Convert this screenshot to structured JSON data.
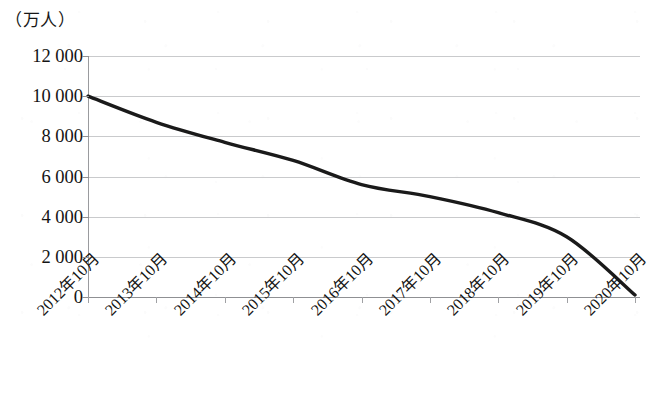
{
  "chart_data": {
    "type": "line",
    "title": "",
    "subtitle": "",
    "xlabel": "",
    "ylabel": "（万人）",
    "y_axis_unit_caption": "（万人）",
    "categories": [
      "2012年10月",
      "2013年10月",
      "2014年10月",
      "2015年10月",
      "2016年10月",
      "2017年10月",
      "2018年10月",
      "2019年10月",
      "2020年10月"
    ],
    "values": [
      10000,
      8700,
      7700,
      6800,
      5600,
      5000,
      4200,
      3000,
      100
    ],
    "series": [
      {
        "name": "",
        "values": [
          10000,
          8700,
          7700,
          6800,
          5600,
          5000,
          4200,
          3000,
          100
        ]
      }
    ],
    "ylim": [
      0,
      12000
    ],
    "ytick_labels": [
      "0",
      "2 000",
      "4 000",
      "6 000",
      "8 000",
      "10 000",
      "12 000"
    ],
    "ytick_values": [
      0,
      2000,
      4000,
      6000,
      8000,
      10000,
      12000
    ],
    "grid": true,
    "grid_axis": "y",
    "legend": false,
    "legend_position": "none",
    "line_color": "#1a1a1a",
    "line_width": 3.4,
    "gridline_color": "#c9cacc",
    "axis_color": "#8f9093",
    "background_color": "#ffffff",
    "xtick_label_rotation": -45
  }
}
